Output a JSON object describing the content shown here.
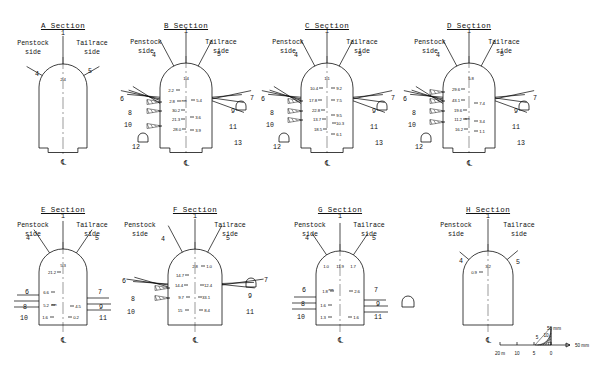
{
  "figure": {
    "penstock_label": "Penstock\nside",
    "tailrace_label": "Tailrace\nside",
    "centerline_symbol": "℄",
    "unit_note": "mm"
  },
  "scale": {
    "name": "scale-bar",
    "top_label": "50 mm",
    "right_label": "50 mm",
    "ticks": [
      "20 m",
      "10",
      "5",
      "0"
    ],
    "inner_ticks": [
      "5",
      "10"
    ]
  },
  "sections": [
    {
      "id": "A",
      "title": "A Section",
      "penstock": "Penstock\nside",
      "tailrace": "Tailrace\nside",
      "callouts": [
        "1",
        "4",
        "5"
      ],
      "values": {
        "crown": "2.4"
      },
      "left_values": [],
      "right_values": []
    },
    {
      "id": "B",
      "title": "B Section",
      "penstock": "Penstock\nside",
      "tailrace": "Tailrace\nside",
      "callouts": [
        "1",
        "4",
        "5",
        "6",
        "7",
        "8",
        "9",
        "10",
        "11",
        "12",
        "13"
      ],
      "values": {
        "crown": "1.4"
      },
      "left_values": [
        "2.2",
        "2.8",
        "30.2",
        "21.3",
        "28.0"
      ],
      "right_values": [
        "5.4",
        "3.6",
        "3.9"
      ],
      "unit_marker": "mm"
    },
    {
      "id": "C",
      "title": "C Section",
      "penstock": "Penstock\nside",
      "tailrace": "Tailrace\nside",
      "callouts": [
        "1",
        "4",
        "5",
        "6",
        "7",
        "8",
        "9",
        "10",
        "11",
        "12",
        "13"
      ],
      "values": {
        "crown": "1.1"
      },
      "left_values": [
        "10.4",
        "17.8",
        "22.8",
        "13.7",
        "18.5"
      ],
      "right_values": [
        "9.2",
        "7.5",
        "9.5",
        "10.3",
        "6.1"
      ]
    },
    {
      "id": "D",
      "title": "D Section",
      "penstock": "Penstock\nside",
      "tailrace": "Tailrace\nside",
      "callouts": [
        "1",
        "4",
        "5",
        "6",
        "7",
        "8",
        "9",
        "10",
        "11",
        "12",
        "13"
      ],
      "values": {
        "crown": "5.8"
      },
      "left_values": [
        "29.6",
        "43.1",
        "19.6",
        "11.2",
        "16.2"
      ],
      "right_values": [
        "7.4",
        "3.4",
        "1.1"
      ],
      "unit_marker": "mm"
    },
    {
      "id": "E",
      "title": "E Section",
      "penstock": "Penstock\nside",
      "tailrace": "Tailrace\nside",
      "callouts": [
        "1",
        "4",
        "5",
        "6",
        "7",
        "8",
        "9",
        "10",
        "11"
      ],
      "values": {
        "crown": "5.3"
      },
      "left_values": [
        "21.2",
        "6.6",
        "5.2",
        "1.6"
      ],
      "right_values": [
        "4.5",
        "0.2"
      ],
      "unit_marker": "mm"
    },
    {
      "id": "F",
      "title": "F Section",
      "penstock": "Penstock\nside",
      "tailrace": "Tailrace\nside",
      "callouts": [
        "1",
        "4",
        "5",
        "6",
        "7",
        "8",
        "9",
        "10",
        "11"
      ],
      "values": {
        "crown": "2.8"
      },
      "left_values": [
        "14.7",
        "14.4",
        "9.7",
        "15"
      ],
      "right_values": [
        "1.0",
        "12.4",
        "33.1",
        "8.4"
      ]
    },
    {
      "id": "G",
      "title": "G Section",
      "penstock": "Penstock\nside",
      "tailrace": "Tailrace\nside",
      "callouts": [
        "1",
        "4",
        "5",
        "6",
        "7",
        "8",
        "9",
        "10",
        "11"
      ],
      "values": {
        "crown": "11.9",
        "crown_left": "1.0",
        "crown_right": "1.7"
      },
      "left_values": [
        "1.8",
        "1.6",
        "1.3"
      ],
      "right_values": [
        "2.6",
        "1.6"
      ],
      "unit_marker": "mm"
    },
    {
      "id": "H",
      "title": "H Section",
      "penstock": "Penstock\nside",
      "tailrace": "Tailrace\nside",
      "callouts": [
        "1",
        "4",
        "5"
      ],
      "values": {
        "crown": "3.2"
      },
      "left_values": [
        "0.9"
      ],
      "right_values": []
    }
  ]
}
